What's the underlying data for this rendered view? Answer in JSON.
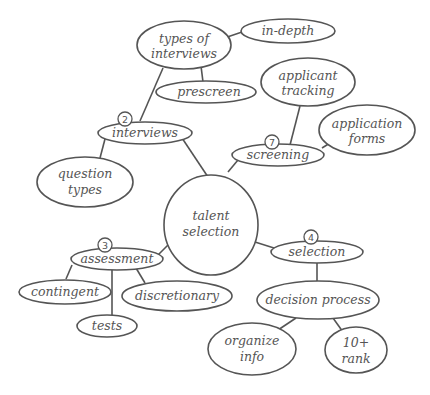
{
  "diagram": {
    "type": "mind-map",
    "center": {
      "id": "talent-selection",
      "lines": [
        "talent",
        "selection"
      ]
    },
    "nodes": [
      {
        "id": "types-of-interviews",
        "lines": [
          "types of",
          "interviews"
        ]
      },
      {
        "id": "in-depth",
        "lines": [
          "in-depth"
        ]
      },
      {
        "id": "prescreen",
        "lines": [
          "prescreen"
        ]
      },
      {
        "id": "interviews",
        "lines": [
          "interviews"
        ],
        "badge": "2"
      },
      {
        "id": "question-types",
        "lines": [
          "question",
          "types"
        ]
      },
      {
        "id": "applicant-tracking",
        "lines": [
          "applicant",
          "tracking"
        ]
      },
      {
        "id": "application-forms",
        "lines": [
          "application",
          "forms"
        ]
      },
      {
        "id": "screening",
        "lines": [
          "screening"
        ],
        "badge": "7"
      },
      {
        "id": "assessment",
        "lines": [
          "assessment"
        ],
        "badge": "3"
      },
      {
        "id": "contingent",
        "lines": [
          "contingent"
        ]
      },
      {
        "id": "discretionary",
        "lines": [
          "discretionary"
        ]
      },
      {
        "id": "tests",
        "lines": [
          "tests"
        ]
      },
      {
        "id": "selection",
        "lines": [
          "selection"
        ],
        "badge": "4"
      },
      {
        "id": "decision-process",
        "lines": [
          "decision process"
        ]
      },
      {
        "id": "organize-info",
        "lines": [
          "organize",
          "info"
        ]
      },
      {
        "id": "10-rank",
        "lines": [
          "10+",
          "rank"
        ]
      }
    ],
    "edges": [
      [
        "talent-selection",
        "interviews"
      ],
      [
        "talent-selection",
        "screening"
      ],
      [
        "talent-selection",
        "assessment"
      ],
      [
        "talent-selection",
        "selection"
      ],
      [
        "interviews",
        "types-of-interviews"
      ],
      [
        "interviews",
        "question-types"
      ],
      [
        "types-of-interviews",
        "in-depth"
      ],
      [
        "types-of-interviews",
        "prescreen"
      ],
      [
        "screening",
        "applicant-tracking"
      ],
      [
        "screening",
        "application-forms"
      ],
      [
        "assessment",
        "contingent"
      ],
      [
        "assessment",
        "tests"
      ],
      [
        "assessment",
        "discretionary"
      ],
      [
        "selection",
        "decision-process"
      ],
      [
        "decision-process",
        "organize-info"
      ],
      [
        "decision-process",
        "10-rank"
      ]
    ]
  },
  "labels": {
    "center_1": "talent",
    "center_2": "selection",
    "types_1": "types of",
    "types_2": "interviews",
    "indepth": "in-depth",
    "prescreen": "prescreen",
    "interviews": "interviews",
    "interviews_badge": "2",
    "question_1": "question",
    "question_2": "types",
    "applicant_1": "applicant",
    "applicant_2": "tracking",
    "appforms_1": "application",
    "appforms_2": "forms",
    "screening": "screening",
    "screening_badge": "7",
    "assessment": "assessment",
    "assessment_badge": "3",
    "contingent": "contingent",
    "discretionary": "discretionary",
    "tests": "tests",
    "selection": "selection",
    "selection_badge": "4",
    "decision": "decision process",
    "organize_1": "organize",
    "organize_2": "info",
    "rank_1": "10+",
    "rank_2": "rank"
  }
}
